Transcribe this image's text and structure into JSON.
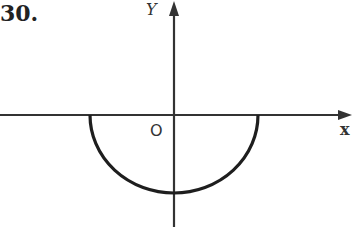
{
  "problem_number": "30.",
  "axes": {
    "y_label": "Y",
    "x_label": "x",
    "origin_label": "O"
  },
  "curve": {
    "description": "lower semicircle centered at origin, below x-axis",
    "type": "semicircle-lower"
  },
  "colors": {
    "ink": "#222222",
    "background": "#ffffff"
  }
}
